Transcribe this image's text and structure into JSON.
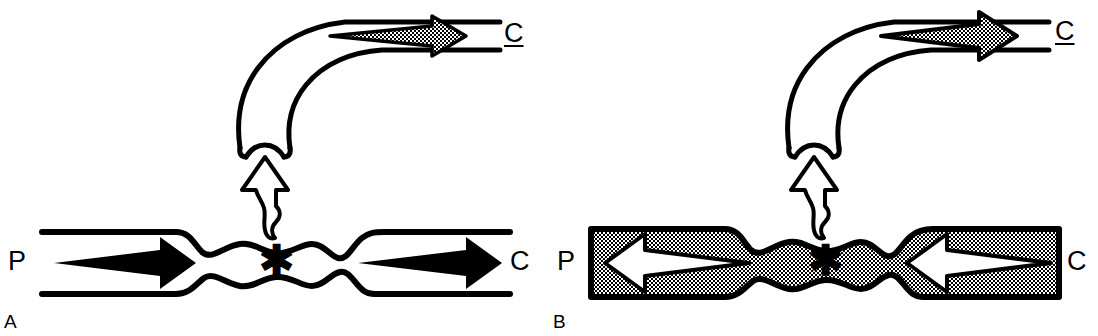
{
  "figure": {
    "background_color": "#ffffff",
    "stroke_color": "#000000",
    "fill_gray": "#8c8c8c",
    "width": 1098,
    "height": 336
  },
  "panels": [
    {
      "id": "A",
      "letter": "A",
      "lumen_fill": "#ffffff",
      "stenosis_marker": "*",
      "labels": {
        "proximal": "P",
        "distal": "C",
        "branch": "C"
      },
      "flow": {
        "proximal_arrow": {
          "direction": "right",
          "style": "solid-black"
        },
        "distal_arrow": {
          "direction": "right",
          "style": "solid-black"
        },
        "branch_arrow": {
          "direction": "right",
          "style": "gray-filled"
        },
        "leak_arrow": {
          "direction": "up",
          "style": "hollow-white"
        }
      }
    },
    {
      "id": "B",
      "letter": "B",
      "lumen_fill": "#8c8c8c",
      "stenosis_marker": "*",
      "labels": {
        "proximal": "P",
        "distal": "C",
        "branch": "C"
      },
      "flow": {
        "proximal_arrow": {
          "direction": "left",
          "style": "hollow-white"
        },
        "distal_arrow": {
          "direction": "left",
          "style": "hollow-white"
        },
        "branch_arrow": {
          "direction": "right",
          "style": "gray-filled"
        },
        "leak_arrow": {
          "direction": "up",
          "style": "hollow-white"
        }
      }
    }
  ]
}
